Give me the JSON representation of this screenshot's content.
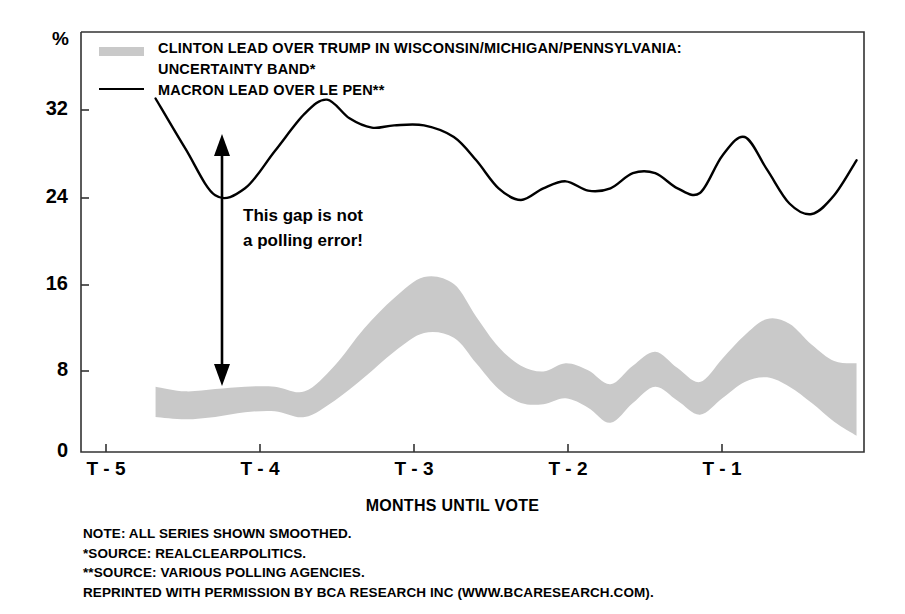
{
  "chart_data": {
    "type": "line",
    "title": "",
    "xlabel": "MONTHS UNTIL VOTE",
    "ylabel": "%",
    "ylim": [
      0,
      36
    ],
    "yticks": [
      0,
      8,
      16,
      24,
      32
    ],
    "ytick_labels": [
      "0",
      "8",
      "16",
      "24",
      "32"
    ],
    "xlim": [
      -5.5,
      -0.25
    ],
    "xticks": [
      -5,
      -4,
      -3,
      -2,
      -1
    ],
    "xtick_labels": [
      "T - 5",
      "T - 4",
      "T - 3",
      "T - 2",
      "T - 1"
    ],
    "grid": false,
    "legend_position": "top-left",
    "series": [
      {
        "name": "CLINTON LEAD OVER TRUMP IN WISCONSIN/MICHIGAN/PENNSYLVANIA: UNCERTAINTY BAND*",
        "type": "area-band",
        "color": "#c9c9c9",
        "x": [
          -5.0,
          -4.8,
          -4.6,
          -4.4,
          -4.2,
          -4.0,
          -3.8,
          -3.6,
          -3.4,
          -3.2,
          -3.0,
          -2.85,
          -2.7,
          -2.55,
          -2.4,
          -2.25,
          -2.1,
          -1.95,
          -1.8,
          -1.65,
          -1.5,
          -1.35,
          -1.2,
          -1.05,
          -0.9,
          -0.75,
          -0.6,
          -0.45,
          -0.3
        ],
        "upper": [
          5.6,
          5.2,
          5.4,
          5.6,
          5.6,
          5.2,
          7.4,
          10.6,
          13.2,
          15.0,
          14.4,
          11.6,
          9.0,
          7.4,
          6.9,
          7.6,
          7.0,
          5.8,
          7.4,
          8.6,
          7.2,
          6.0,
          8.0,
          10.0,
          11.4,
          11.0,
          9.2,
          7.8,
          7.6
        ],
        "lower": [
          3.0,
          2.8,
          3.0,
          3.4,
          3.5,
          3.0,
          4.4,
          6.4,
          8.6,
          10.2,
          9.8,
          7.6,
          5.4,
          4.2,
          4.1,
          4.6,
          3.8,
          2.5,
          4.2,
          5.6,
          4.4,
          3.2,
          4.6,
          6.0,
          6.4,
          5.6,
          4.2,
          2.6,
          1.4
        ]
      },
      {
        "name": "MACRON LEAD OVER LE PEN**",
        "type": "line",
        "color": "#000000",
        "x": [
          -5.0,
          -4.8,
          -4.6,
          -4.4,
          -4.2,
          -4.0,
          -3.85,
          -3.7,
          -3.55,
          -3.4,
          -3.2,
          -3.0,
          -2.85,
          -2.7,
          -2.55,
          -2.4,
          -2.25,
          -2.1,
          -1.95,
          -1.8,
          -1.65,
          -1.5,
          -1.35,
          -1.2,
          -1.05,
          -0.9,
          -0.75,
          -0.6,
          -0.45,
          -0.3
        ],
        "y": [
          30.3,
          26.0,
          22.0,
          22.6,
          25.8,
          29.0,
          30.2,
          28.6,
          27.8,
          28.0,
          28.0,
          27.0,
          25.0,
          22.6,
          21.6,
          22.6,
          23.2,
          22.4,
          22.6,
          23.9,
          23.9,
          22.6,
          22.2,
          25.4,
          27.0,
          24.2,
          21.3,
          20.4,
          22.0,
          25.0
        ]
      }
    ],
    "annotations": [
      {
        "name": "gap-annotation",
        "text": "This gap is not\na polling error!",
        "arrow": "double-headed vertical arrow from y=8 to y=30 at x = T-4.2"
      }
    ]
  },
  "legend": {
    "band_label_line1": "CLINTON LEAD OVER TRUMP IN WISCONSIN/MICHIGAN/PENNSYLVANIA:",
    "band_label_line2": "UNCERTAINTY BAND*",
    "line_label": "MACRON LEAD OVER LE PEN**",
    "band_color": "#c9c9c9",
    "line_color": "#000000"
  },
  "axes": {
    "y_unit_label": "%",
    "y_tick_labels": [
      "32",
      "24",
      "16",
      "8",
      "0"
    ],
    "x_tick_labels": [
      "T - 5",
      "T - 4",
      "T - 3",
      "T - 2",
      "T - 1"
    ],
    "x_axis_title": "MONTHS UNTIL VOTE"
  },
  "annotation": {
    "text": "This gap is not\na polling error!"
  },
  "footnotes": {
    "line1": "NOTE: ALL SERIES SHOWN SMOOTHED.",
    "line2": "*SOURCE: REALCLEARPOLITICS.",
    "line3": "**SOURCE: VARIOUS POLLING AGENCIES.",
    "line4": "REPRINTED WITH PERMISSION BY BCA RESEARCH INC (WWW.BCARESEARCH.COM)."
  }
}
